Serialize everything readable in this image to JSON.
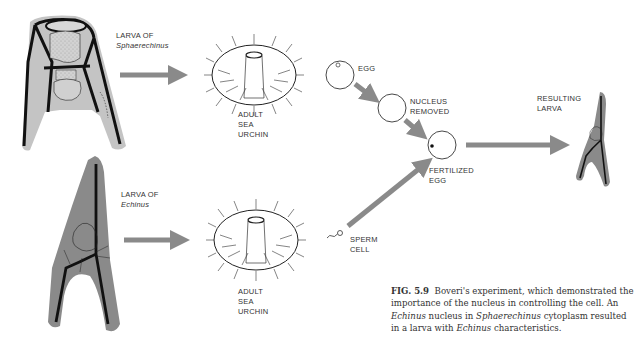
{
  "figure": {
    "number": "FIG. 5.9",
    "caption_parts": {
      "p1": "Boveri's experiment, which demonstrated the importance of the nucleus in controlling the cell. An ",
      "p2_italic": "Echinus",
      "p3": " nucleus in ",
      "p4_italic": "Sphaerechinus",
      "p5": " cytoplasm resulted in a larva with ",
      "p6_italic": "Echinus",
      "p7": " characteristics."
    }
  },
  "labels": {
    "larva_top_line1": "LARVA OF",
    "larva_top_line2": "Sphaerechinus",
    "larva_bottom_line1": "LARVA OF",
    "larva_bottom_line2": "Echinus",
    "urchin_top": [
      "ADULT",
      "SEA",
      "URCHIN"
    ],
    "urchin_bottom": [
      "ADULT",
      "SEA",
      "URCHIN"
    ],
    "egg": "EGG",
    "nucleus_removed": [
      "NUCLEUS",
      "REMOVED"
    ],
    "fertilized_egg": [
      "FERTILIZED",
      "EGG"
    ],
    "sperm_cell": [
      "SPERM",
      "CELL"
    ],
    "resulting_larva": [
      "RESULTING",
      "LARVA"
    ]
  },
  "colors": {
    "arrow": "#8a8a8a",
    "larva_fill_light": "#c8c8c8",
    "larva_fill_dark": "#8c8c8c",
    "skeleton": "#111111",
    "text": "#333333"
  }
}
